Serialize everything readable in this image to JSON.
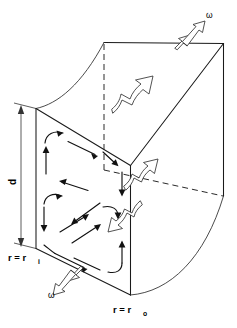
{
  "figure": {
    "labels": {
      "depth_dimension": "d",
      "inner_radius": "r = r",
      "inner_radius_sub": "i",
      "outer_radius": "r = r",
      "outer_radius_sub": "o",
      "angular_velocity_top": "ω",
      "angular_velocity_bottom": "ω"
    },
    "icons": {
      "rotation_arrow_top": "hollow-arrow-up-right",
      "rotation_arrow_bottom": "hollow-arrow-down-left",
      "through_flow_arrow_back": "hollow-arrow-up-right",
      "through_flow_arrow_mid": "hollow-arrow-up-right",
      "through_flow_arrow_low": "hollow-arrow-down-left",
      "dimension_arrow": "double-headed-vertical-arrow"
    },
    "geometry": {
      "front_face": "rectangular inner face at r = r_i",
      "top_face": "curved annular top surface",
      "bottom_face": "curved annular bottom surface",
      "outer_surface": "curved cylindrical surface at r = r_o",
      "hidden_edges": "dashed"
    },
    "flow": {
      "description": "Counter-rotating secondary vortex cells on the meridional plane",
      "cell_count": 2,
      "arrow_style": "solid filled arrowheads along streamlines"
    },
    "colors": {
      "background": "#ffffff",
      "edge": "#1a1a1a",
      "hidden_edge": "#2a2a2a",
      "flow": "#111111",
      "hollow_arrow_fill": "#ffffff",
      "hollow_arrow_stroke": "#333333",
      "text": "#000000"
    }
  }
}
